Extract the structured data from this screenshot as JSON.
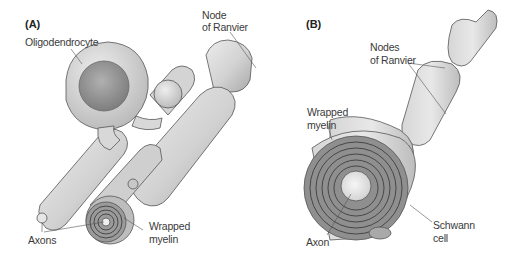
{
  "figure": {
    "panels": [
      {
        "id": "A",
        "label": "(A)",
        "title": "Oligodendrocyte myelination (CNS)",
        "annotations": {
          "oligodendrocyte": "Oligodendrocyte",
          "node_line1": "Node",
          "node_line2": "of Ranvier",
          "axons": "Axons",
          "wrapped_line1": "Wrapped",
          "wrapped_line2": "myelin"
        }
      },
      {
        "id": "B",
        "label": "(B)",
        "title": "Schwann cell myelination (PNS)",
        "annotations": {
          "nodes_line1": "Nodes",
          "nodes_line2": "of Ranvier",
          "wrapped_line1": "Wrapped",
          "wrapped_line2": "myelin",
          "axon": "Axon",
          "schwann_line1": "Schwann",
          "schwann_line2": "cell"
        }
      }
    ],
    "colors": {
      "background": "#ffffff",
      "membrane_light": "#e2e2e2",
      "membrane_mid": "#c4c4c4",
      "membrane_dark": "#8e8e8e",
      "nucleus": "#9a9a9a",
      "outline": "#555555",
      "text": "#3a3a3a"
    }
  }
}
